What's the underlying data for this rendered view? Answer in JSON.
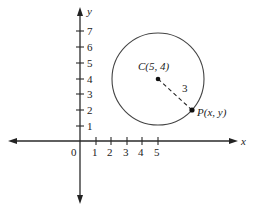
{
  "figure": {
    "type": "coordinate-plane-circle",
    "axes": {
      "x_label": "x",
      "y_label": "y",
      "origin_label": "0",
      "x_ticks": [
        "1",
        "2",
        "3",
        "4",
        "5"
      ],
      "y_ticks": [
        "1",
        "2",
        "3",
        "4",
        "5",
        "6",
        "7"
      ]
    },
    "circle": {
      "center_label": "C(5, 4)",
      "center": [
        5,
        4
      ],
      "radius": 3,
      "radius_label": "3"
    },
    "point": {
      "label": "P(x, y)"
    }
  }
}
